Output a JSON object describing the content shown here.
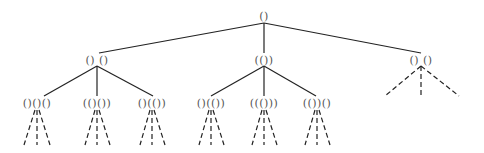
{
  "diagram": {
    "type": "tree",
    "root": {
      "label": "()",
      "x": 264,
      "y": 16
    },
    "level2": [
      {
        "label": "() ()",
        "x": 97,
        "y": 60
      },
      {
        "label": "(())",
        "x": 264,
        "y": 60
      },
      {
        "label": "() ()",
        "x": 421,
        "y": 60
      }
    ],
    "level3": [
      {
        "label": "()()()",
        "x": 30,
        "y": 103,
        "parent": 0
      },
      {
        "label": "(()())",
        "x": 97,
        "y": 103,
        "parent": 0
      },
      {
        "label": "()(())",
        "x": 152,
        "y": 103,
        "parent": 0
      },
      {
        "label": "()(())",
        "x": 208,
        "y": 103,
        "parent": 1
      },
      {
        "label": "((()))",
        "x": 264,
        "y": 103,
        "parent": 1
      },
      {
        "label": "(())()",
        "x": 317,
        "y": 103,
        "parent": 1
      }
    ],
    "colors": {
      "edge": "#222222",
      "label": "#555555",
      "background": "#ffffff"
    }
  }
}
